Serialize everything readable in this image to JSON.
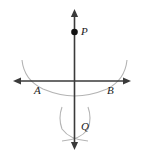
{
  "figure": {
    "background_color": "#ffffff",
    "axis_color": "#3a3a3a",
    "arc_color": "#b4b4b4",
    "point_color": "#111111",
    "label_color": "#1a1a1a",
    "width": 142,
    "height": 158
  },
  "axes": {
    "horizontal": {
      "name": "horizontal-line",
      "y": 81,
      "x_start": 13,
      "x_end": 131,
      "arrow_start": true,
      "arrow_end": true
    },
    "vertical": {
      "name": "vertical-line",
      "x": 74.5,
      "y_start": 9,
      "y_end": 150,
      "arrow_start": true,
      "arrow_end": true
    }
  },
  "points": [
    {
      "id": "P",
      "label": "P",
      "x": 74.5,
      "y": 32,
      "dot": true,
      "label_x": 81,
      "label_y": 35
    },
    {
      "id": "A",
      "label": "A",
      "x": 38,
      "y": 81,
      "dot": false,
      "label_x": 34,
      "label_y": 94
    },
    {
      "id": "B",
      "label": "B",
      "x": 111,
      "y": 81,
      "dot": false,
      "label_x": 107,
      "label_y": 94
    },
    {
      "id": "Q",
      "label": "Q",
      "x": 74.5,
      "y": 122,
      "dot": false,
      "label_x": 81,
      "label_y": 130
    }
  ],
  "arcs": [
    {
      "name": "arc-from-P-through-A-and-B",
      "description": "large compass arc centered at P intersecting the line at A and B",
      "path": "M 22 60 Q 24 80 43 89 Q 60 96 74.5 96 Q 90 96 107 89 Q 125 80 127 60"
    },
    {
      "name": "arc-from-A-below",
      "description": "compass arc centered at A crossing below the line at Q",
      "path": "M 62 107 Q 58 118 62 129 Q 70 140 88 141"
    },
    {
      "name": "arc-from-B-below",
      "description": "compass arc centered at B crossing below the line at Q",
      "path": "M 88 107 Q 92 118 88 129 Q 80 140 62 141"
    }
  ]
}
